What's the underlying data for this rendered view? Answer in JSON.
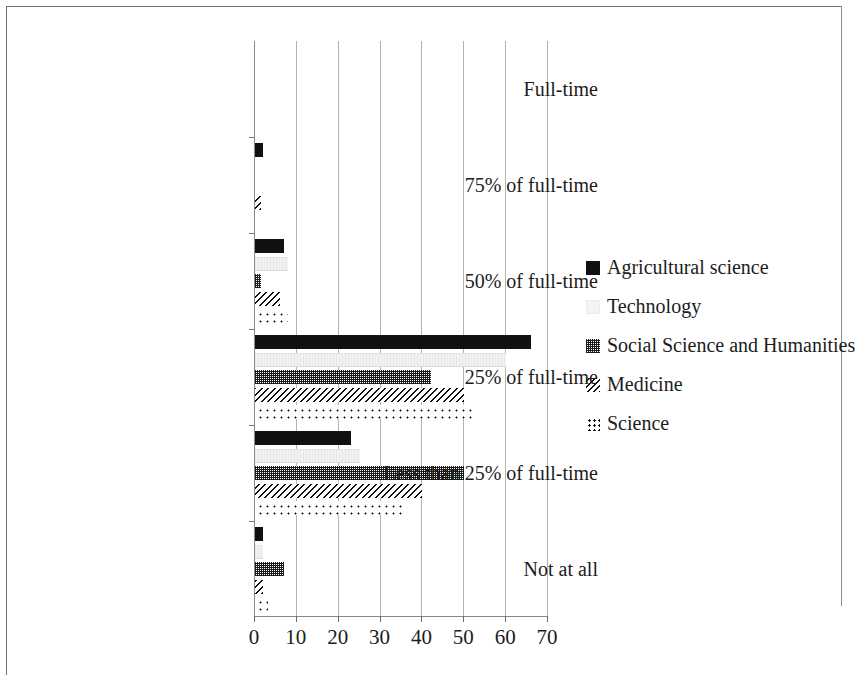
{
  "chart_data": {
    "type": "bar",
    "orientation": "horizontal",
    "title": "",
    "xlabel": "",
    "ylabel": "",
    "xlim": [
      0,
      70
    ],
    "xticks": [
      0,
      10,
      20,
      30,
      40,
      50,
      60,
      70
    ],
    "xtick_labels": [
      "0",
      "10",
      "20",
      "30",
      "40",
      "50",
      "60",
      "70"
    ],
    "grid": "vertical",
    "legend_position": "right",
    "categories": [
      "Full-time",
      "75% of full-time",
      "50% of full-time",
      "25% of full-time",
      "Less than 25% of full-time",
      "Not at all"
    ],
    "series": [
      {
        "name": "Agricultural science",
        "pattern": "solid-black",
        "color": "#111111",
        "values": [
          0,
          2,
          7,
          66,
          23,
          2
        ]
      },
      {
        "name": "Technology",
        "pattern": "light-solid",
        "color": "#f2f2f2",
        "values": [
          0,
          0,
          8,
          60,
          25,
          2
        ]
      },
      {
        "name": "Social Science and Humanities",
        "pattern": "checkerboard",
        "color": "#1a1a1a",
        "values": [
          0,
          0,
          1.5,
          42,
          50,
          7
        ]
      },
      {
        "name": "Medicine",
        "pattern": "diagonal-hatch",
        "color": "#101010",
        "values": [
          0,
          1.5,
          6,
          50,
          40,
          2
        ]
      },
      {
        "name": "Science",
        "pattern": "dotted",
        "color": "#111111",
        "values": [
          1,
          1,
          8,
          52,
          36,
          3
        ]
      }
    ]
  }
}
